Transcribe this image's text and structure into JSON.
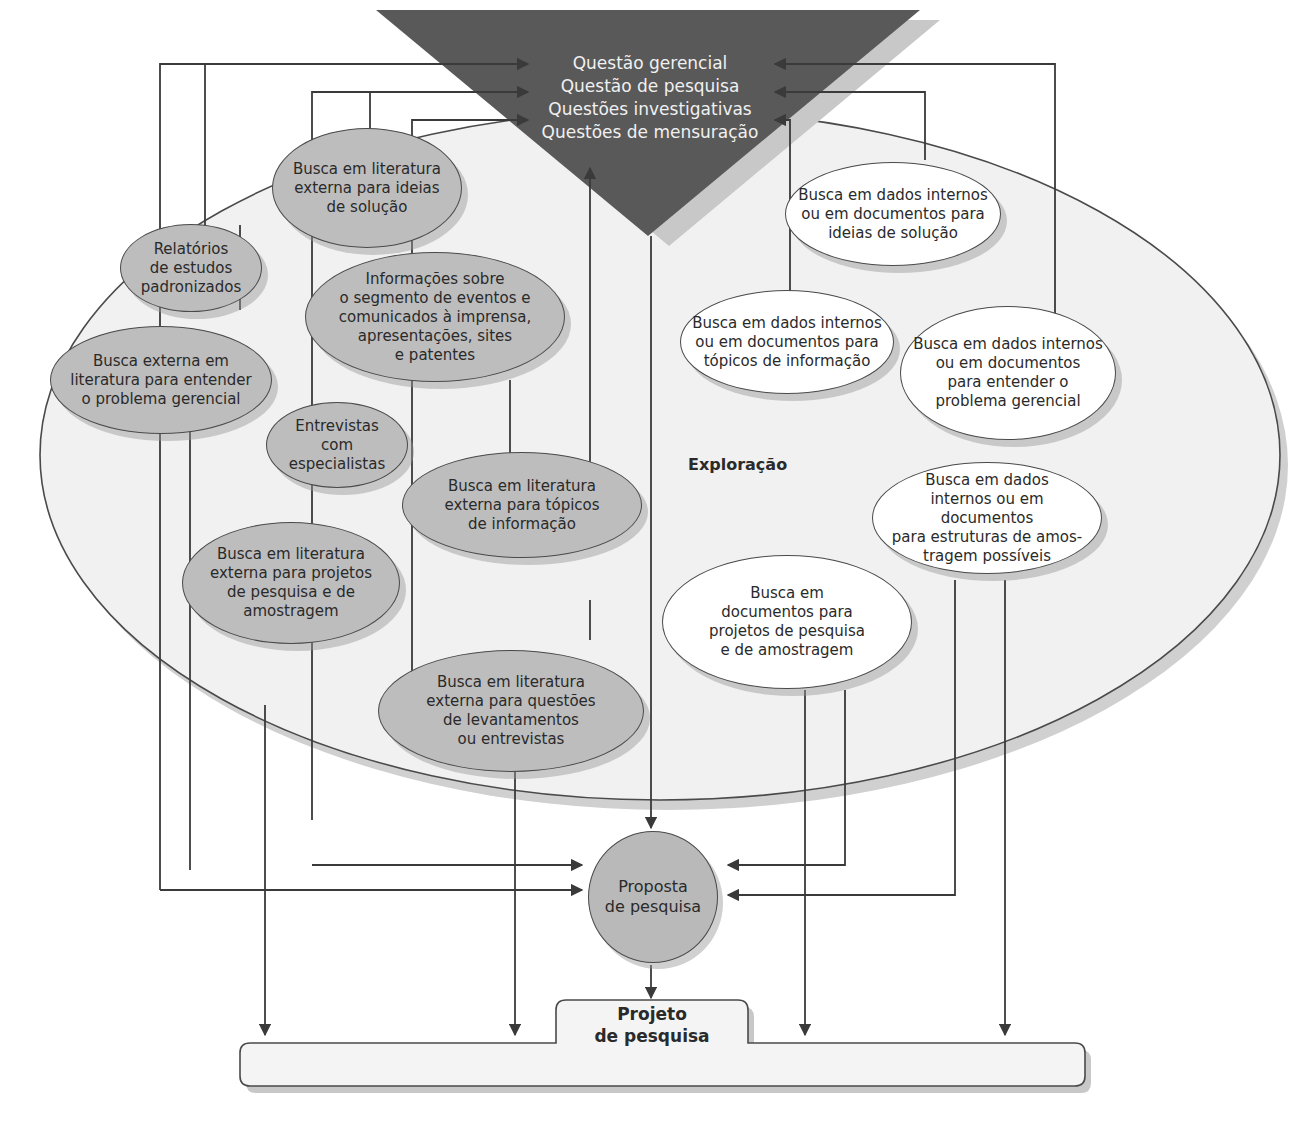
{
  "diagram": {
    "top_triangle": {
      "lines": [
        "Questão gerencial",
        "Questão de pesquisa",
        "Questões investigativas",
        "Questões de mensuração"
      ],
      "fill": "#595959",
      "text_color": "#f0f0f0"
    },
    "exploration_area": {
      "label": "Exploração",
      "fill": "#f1f1f1"
    },
    "nodes_external_gray": [
      {
        "id": "lit-ideias",
        "text": "Busca em literatura\nexterna para ideias\nde solução"
      },
      {
        "id": "relatorios",
        "text": "Relatórios\nde estudos\npadronizados"
      },
      {
        "id": "informacoes",
        "text": "Informações sobre\no segmento de eventos e\ncomunicados à imprensa,\napresentações, sites\ne patentes"
      },
      {
        "id": "busca-externa-problema",
        "text": "Busca externa em\nliteratura para entender\no problema gerencial"
      },
      {
        "id": "entrevistas",
        "text": "Entrevistas com\nespecialistas"
      },
      {
        "id": "lit-topicos",
        "text": "Busca em literatura\nexterna para tópicos\nde informação"
      },
      {
        "id": "lit-projetos",
        "text": "Busca em literatura\nexterna para projetos\nde pesquisa e de\namostragem"
      },
      {
        "id": "lit-questoes",
        "text": "Busca em literatura\nexterna para questões\nde levantamentos\nou entrevistas"
      }
    ],
    "nodes_internal_white": [
      {
        "id": "int-ideias",
        "text": "Busca em dados internos\nou em documentos para\nideias de solução"
      },
      {
        "id": "int-topicos",
        "text": "Busca em dados internos\nou em documentos para\ntópicos de informação"
      },
      {
        "id": "int-problema",
        "text": "Busca em dados internos\nou em documentos\npara entender o\nproblema gerencial"
      },
      {
        "id": "int-amostragem",
        "text": "Busca em dados\ninternos ou em documentos\npara estruturas de amos-\ntragem possíveis"
      },
      {
        "id": "doc-projetos",
        "text": "Busca em\ndocumentos para\nprojetos de pesquisa\ne de amostragem"
      }
    ],
    "proposal": {
      "text": "Proposta\nde pesquisa",
      "fill": "#b9b9b9"
    },
    "project": {
      "text": "Projeto\nde pesquisa",
      "fill": "#f4f4f4"
    },
    "line_color": "#3a3a3a"
  }
}
